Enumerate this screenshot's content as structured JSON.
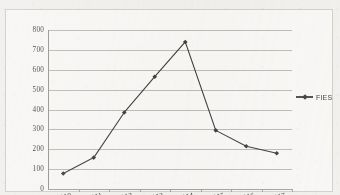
{
  "chart_data": {
    "type": "line",
    "title": "",
    "xlabel": "",
    "ylabel": "",
    "categories": [
      "2010",
      "2011",
      "2012",
      "2013",
      "2014",
      "2015",
      "2016",
      "2017"
    ],
    "series": [
      {
        "name": "FIES",
        "values": [
          78,
          158,
          385,
          565,
          740,
          295,
          215,
          180
        ],
        "color": "#2a2826",
        "marker": "diamond"
      }
    ],
    "ylim": [
      0,
      800
    ],
    "ytick_step": 100,
    "yticks": [
      "800",
      "700",
      "600",
      "500",
      "400",
      "300",
      "200",
      "100",
      "0"
    ],
    "grid": "horizontal",
    "legend_position": "right",
    "legend_entries": [
      "FIES"
    ]
  },
  "legend": {
    "label": "FIES",
    "marker_icon": "diamond-marker-icon",
    "line_icon": "legend-line-icon"
  },
  "axes": {
    "y_axis_name": "y-axis",
    "x_axis_name": "x-axis"
  },
  "colors": {
    "series": "#2a2826",
    "gridline": "#b9b6b0",
    "axis": "#8d8a84",
    "text": "#2e2c2a",
    "plot_background": "#fbfaf8",
    "page_background": "#f3f1ee"
  }
}
